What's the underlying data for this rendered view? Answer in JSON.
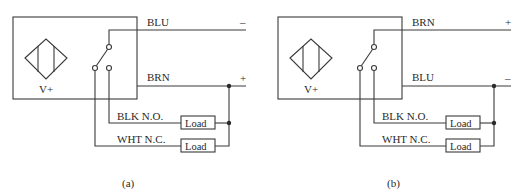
{
  "figure": {
    "panels": [
      {
        "caption": "(a)",
        "sensor_label": "V+",
        "top_wire": {
          "label": "BLU",
          "polarity": "–"
        },
        "middle_wire": {
          "label": "BRN",
          "polarity": "+"
        },
        "no_wire": {
          "label": "BLK N.O.",
          "load": "Load"
        },
        "nc_wire": {
          "label": "WHT N.C.",
          "load": "Load"
        }
      },
      {
        "caption": "(b)",
        "sensor_label": "V+",
        "top_wire": {
          "label": "BRN",
          "polarity": "+"
        },
        "middle_wire": {
          "label": "BLU",
          "polarity": "–"
        },
        "no_wire": {
          "label": "BLK N.O.",
          "load": "Load"
        },
        "nc_wire": {
          "label": "WHT N.C.",
          "load": "Load"
        }
      }
    ],
    "colors": {
      "line": "#3a3a3a",
      "text": "#2a2a2a",
      "background": "#ffffff"
    }
  }
}
